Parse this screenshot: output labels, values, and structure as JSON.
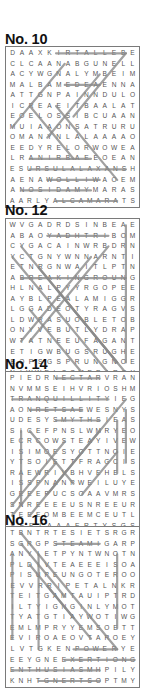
{
  "puzzles": [
    {
      "title": "No. 10",
      "top": 32,
      "box_top": 46,
      "rows": [
        "DAAXKIRTALLEBE",
        "CLCAANABGUNELL",
        "ACYWGNALYMBEIM",
        "MALBAMEDEAENNA",
        "ATTGNPAINNDULO",
        "ICREAEITBAALAT",
        "EOELOSSIBCUAAN",
        "MUIAAONSATRURU",
        "OMANYNLALAAAAO",
        "EEDYRELORWOWEA",
        "LRANIRBAEEOEAN",
        "ESURSULALAXANSH",
        "AENAWOLLIWAOEM",
        "ANOSIDAMYMARAS",
        "AARLYALCAMARATS"
      ],
      "found_lines": [
        [
          5,
          0,
          13,
          0
        ],
        [
          6,
          3,
          10,
          3
        ],
        [
          2,
          11,
          13,
          11
        ],
        [
          2,
          10,
          9,
          10
        ],
        [
          4,
          12,
          10,
          12
        ],
        [
          1,
          13,
          9,
          13
        ],
        [
          5,
          14,
          12,
          14
        ],
        [
          13,
          0,
          7,
          6
        ],
        [
          6,
          1,
          0,
          7
        ],
        [
          10,
          2,
          4,
          8
        ],
        [
          2,
          5,
          7,
          10
        ],
        [
          5,
          5,
          12,
          12
        ]
      ]
    },
    {
      "title": "No. 12",
      "top": 203,
      "box_top": 218,
      "rows": [
        "WVGADRDSINBEAE",
        "ABAOYADHTRIBOM",
        "CYGACAINWRBDRN",
        "YCTGNYWNNARNTI",
        "ETNRGNWAITLPTN",
        "ABREAKINGROUNG",
        "HLNALPYYRGOPEE",
        "AYBLPEALAMIGGR",
        "LGGADEOTYRAGVS",
        "LDWRASUOBLETOB",
        "ONYVEBUTLYDRAP",
        "WTATNEEUFAGANT",
        "ETIGWBUGSRUGHE",
        "EOPSGSPRUNGNOE",
        "NIWWELCOMEPARTY"
      ],
      "found_lines": [
        [
          4,
          1,
          11,
          1
        ],
        [
          1,
          5,
          13,
          5
        ],
        [
          3,
          14,
          13,
          14
        ],
        [
          13,
          0,
          13,
          13
        ],
        [
          1,
          2,
          12,
          13
        ],
        [
          0,
          3,
          11,
          14
        ],
        [
          3,
          4,
          13,
          14
        ],
        [
          11,
          2,
          2,
          11
        ],
        [
          9,
          3,
          1,
          11
        ],
        [
          2,
          8,
          8,
          14
        ],
        [
          5,
          6,
          12,
          13
        ]
      ]
    },
    {
      "title": "No. 14",
      "top": 357,
      "box_top": 371,
      "rows": [
        "PIEDRNECTARVRAN",
        "NVMMSEIHVRIOSHM",
        "TRANQUILLITYIEGY",
        "AONRETSAEWESNYS",
        "UDESYSMYTHSIEAS",
        "SICEFPNSLWMRYEO",
        "ECRCOWSTEAYIVEW",
        "ISIMOESYOTTNOIE",
        "YTSOIETTFRAGCIS",
        "RAEWRIVBHVEHELS",
        "ISSPNANPWEILUYE",
        "GEEEPUCSOAAVMRS",
        "SNREEEEUSNREEUR",
        "TEEEOMBEEMCEUTL",
        "SEFIAAAERTYSGS"
      ],
      "found_lines": [
        [
          5,
          0,
          10,
          0
        ],
        [
          0,
          2,
          11,
          2
        ],
        [
          2,
          3,
          8,
          3
        ],
        [
          5,
          4,
          10,
          4
        ],
        [
          13,
          3,
          13,
          8
        ],
        [
          13,
          2,
          9,
          6
        ],
        [
          2,
          5,
          7,
          10
        ],
        [
          1,
          5,
          1,
          12
        ],
        [
          9,
          6,
          2,
          13
        ],
        [
          12,
          4,
          12,
          9
        ],
        [
          4,
          11,
          10,
          5
        ],
        [
          8,
          11,
          12,
          7
        ],
        [
          0,
          12,
          6,
          6
        ],
        [
          0,
          13,
          5,
          8
        ]
      ]
    },
    {
      "title": "No. 16",
      "top": 513,
      "box_top": 526,
      "rows": [
        "TBNTRTESIETSRGR",
        "SGRGPSTEAMIGARP",
        "ANYIETPYNTWNOTN",
        "PLDIVTEAEEEISOA",
        "PISUPEUNGOTEROO",
        "EVVRRIPETALNKR",
        "TEITGAMTAUIPTRD",
        "ILTYIGNGINLYMOT",
        "TYATGTIAYWOTIWG",
        "EMLMPRYYEMSOETT",
        "EVIROAEOVTAROEY",
        "LVTGKENPOWERYE",
        "EEYGNEEXERTIONG",
        "ENTHUSIASMHPILY",
        "KNHTGNERTSOPTMY"
      ],
      "found_lines": [
        [
          5,
          1,
          10,
          1
        ],
        [
          7,
          11,
          12,
          11
        ],
        [
          6,
          12,
          14,
          12
        ],
        [
          0,
          13,
          10,
          13
        ],
        [
          3,
          14,
          10,
          14
        ],
        [
          0,
          2,
          0,
          10
        ],
        [
          3,
          2,
          3,
          11
        ],
        [
          12,
          2,
          12,
          9
        ],
        [
          1,
          0,
          12,
          11
        ],
        [
          1,
          1,
          6,
          6
        ],
        [
          2,
          3,
          9,
          10
        ],
        [
          4,
          5,
          7,
          8
        ]
      ]
    }
  ],
  "style": {
    "line_color": "#8a8a8a",
    "letter_color": "#555555",
    "border_color": "#7a7a7a"
  }
}
